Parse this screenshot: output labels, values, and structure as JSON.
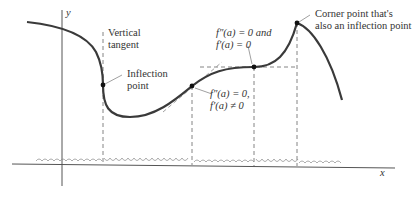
{
  "figure": {
    "axes": {
      "x_label": "x",
      "y_label": "y"
    },
    "annotations": {
      "vertical_tangent": [
        "Vertical",
        "tangent"
      ],
      "inflection_point": [
        "Inflection",
        "point"
      ],
      "second_deriv_zero_first_nonzero": [
        "f″(a) = 0,",
        "f′(a) ≠ 0"
      ],
      "second_deriv_zero_first_zero": [
        "f″(a) = 0 and",
        "f′(a) = 0"
      ],
      "corner_inflection": [
        "Corner point that's",
        "also an inflection point"
      ]
    },
    "concavity_marks": [
      {
        "segment": "left-of-vertical-tangent",
        "shape": "concave-down"
      },
      {
        "segment": "between-inflection-1-and-2",
        "shape": "concave-up"
      },
      {
        "segment": "between-inflection-2-and-3",
        "shape": "concave-down"
      },
      {
        "segment": "between-inflection-3-and-corner",
        "shape": "concave-up"
      },
      {
        "segment": "right-of-corner",
        "shape": "concave-down"
      }
    ],
    "colors": {
      "curve": "#3a3a3a",
      "axes": "#555555",
      "dashed": "#666666",
      "text": "#333333"
    }
  }
}
